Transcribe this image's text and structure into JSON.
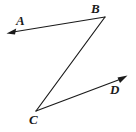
{
  "figure": {
    "kind": "geometry-diagram",
    "canvas": {
      "width": 136,
      "height": 132,
      "background": "#ffffff"
    },
    "stroke": {
      "color": "#1a1a1a",
      "width": 1.2
    },
    "labels": {
      "a": "A",
      "b": "B",
      "c": "C",
      "d": "D"
    },
    "points": {
      "A_arrow_tip": {
        "x": 7,
        "y": 33
      },
      "B_vertex": {
        "x": 105,
        "y": 17
      },
      "C_vertex": {
        "x": 36,
        "y": 111
      },
      "D_arrow_tip": {
        "x": 127,
        "y": 76
      }
    },
    "elements": [
      {
        "name": "ray-BA",
        "type": "ray",
        "from": "B_vertex",
        "to": "A_arrow_tip",
        "arrow_at": "A_arrow_tip"
      },
      {
        "name": "segment-BC",
        "type": "segment",
        "from": "B_vertex",
        "to": "C_vertex",
        "arrow_at": "none"
      },
      {
        "name": "ray-CD",
        "type": "ray",
        "from": "C_vertex",
        "to": "D_arrow_tip",
        "arrow_at": "D_arrow_tip"
      }
    ]
  }
}
